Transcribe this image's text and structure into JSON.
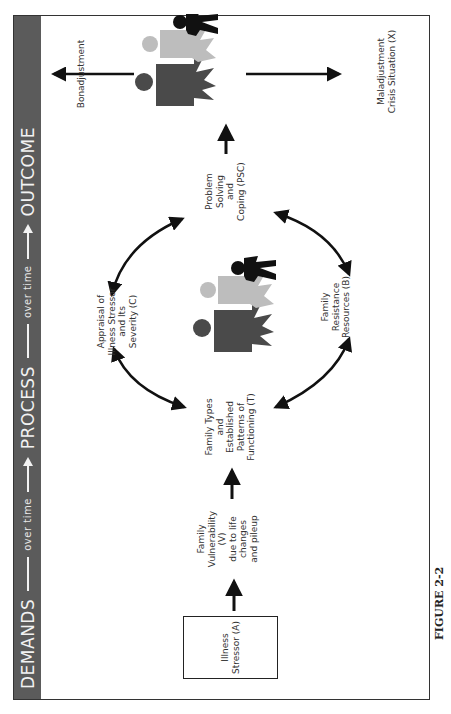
{
  "header": {
    "stages": [
      "DEMANDS",
      "PROCESS",
      "OUTCOME"
    ],
    "connector_label": "over time",
    "background_color": "#5b5b5b",
    "text_color": "#f2f2f2"
  },
  "nodes": {
    "stressor": {
      "text": "Illness Stressor (A)"
    },
    "vulnerability": {
      "lines": [
        "Family",
        "Vulnerability",
        "(V)",
        "due to life",
        "changes",
        "and pileup"
      ]
    },
    "family_types": {
      "lines": [
        "Family Types",
        "and",
        "Established",
        "Patterns of",
        "Functioning (T)"
      ]
    },
    "appraisal": {
      "lines": [
        "Appraisal of",
        "Illness Stressor",
        "and Its",
        "Severity (C)"
      ]
    },
    "resources": {
      "lines": [
        "Family",
        "Resistance",
        "Resources (B)"
      ]
    },
    "coping": {
      "lines": [
        "Problem",
        "Solving",
        "and",
        "Coping (PSC)"
      ]
    },
    "bonadjustment": {
      "text": "Bonadjustment"
    },
    "maladjustment": {
      "lines": [
        "Maladjustment",
        "Crisis Situation (X)"
      ]
    }
  },
  "icons": {
    "center_family": "family-group-icon",
    "outcome_family": "family-group-icon"
  },
  "colors": {
    "figure_dark": "#4a4a4a",
    "figure_light": "#bdbdbd",
    "figure_black": "#111111",
    "arrows": "#111111"
  },
  "caption": "FIGURE 2-2"
}
